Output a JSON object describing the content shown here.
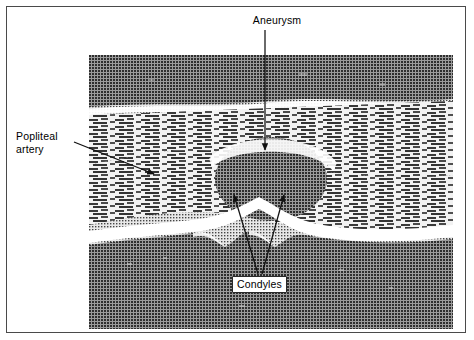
{
  "figure": {
    "kind": "ultrasound-scan-figure",
    "modality_note": "B-mode ultrasound longitudinal scan",
    "frame_color": "#4a4a4a",
    "background_color": "#ffffff"
  },
  "scan": {
    "panel_left": 82,
    "panel_top": 48,
    "panel_width": 364,
    "panel_height": 274,
    "tone_dark": "#3c3c3c",
    "tone_mid": "#777777",
    "tone_bright": "#ffffff",
    "regions": [
      {
        "name": "near-field-shadow",
        "tone": "dark",
        "description": "upper uniform dark band"
      },
      {
        "name": "soft-tissue-striations",
        "tone": "mid",
        "description": "horizontal speckled fascial planes"
      },
      {
        "name": "aneurysm-lumen",
        "tone": "dark",
        "description": "central anechoic rounded mass"
      },
      {
        "name": "bone-surface-echo",
        "tone": "bright",
        "description": "bright curved femoral condyle cortex"
      },
      {
        "name": "acoustic-shadow",
        "tone": "dark",
        "description": "lower dark shadow below bone"
      }
    ]
  },
  "annotations": {
    "aneurysm": {
      "label": "Aneurysm",
      "leader": "vertical-arrow-down",
      "target": "aneurysm-lumen"
    },
    "popliteal_artery": {
      "label": "Popliteal\nartery",
      "leader": "diagonal-arrow-down-right",
      "target": "popliteal-artery-wall"
    },
    "condyles": {
      "label": "Condyles",
      "leader": "double-arrow-v-up",
      "target": "femoral-condyles",
      "boxed": true
    }
  }
}
